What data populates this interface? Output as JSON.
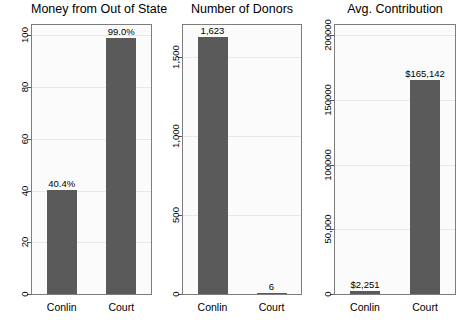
{
  "chart_data": [
    {
      "type": "bar",
      "title": "Money from Out of State",
      "xlabel": "",
      "ylabel": "",
      "categories": [
        "Conlin",
        "Court"
      ],
      "values": [
        40.4,
        99.0
      ],
      "data_labels": [
        "40.4%",
        "99.0%"
      ],
      "ylim": [
        0,
        104
      ],
      "yticks": [
        0,
        20,
        40,
        60,
        80,
        100
      ],
      "ytick_labels": [
        "0",
        "20",
        "40",
        "60",
        "80",
        "100"
      ],
      "grid": true,
      "legend": "none",
      "bar_color": "#5a5a5a"
    },
    {
      "type": "bar",
      "title": "Number of Donors",
      "xlabel": "",
      "ylabel": "",
      "categories": [
        "Conlin",
        "Court"
      ],
      "values": [
        1623,
        6
      ],
      "data_labels": [
        "1,623",
        "6"
      ],
      "ylim": [
        0,
        1700
      ],
      "yticks": [
        0,
        500,
        1000,
        1500
      ],
      "ytick_labels": [
        "0",
        "500",
        "1,000",
        "1,500"
      ],
      "grid": true,
      "legend": "none",
      "bar_color": "#5a5a5a"
    },
    {
      "type": "bar",
      "title": "Avg. Contribution",
      "xlabel": "",
      "ylabel": "",
      "categories": [
        "Conlin",
        "Court"
      ],
      "values": [
        2251,
        165142
      ],
      "data_labels": [
        "$2,251",
        "$165,142"
      ],
      "ylim": [
        0,
        208000
      ],
      "yticks": [
        0,
        50000,
        100000,
        150000,
        200000
      ],
      "ytick_labels": [
        "0",
        "50,000",
        "100000",
        "150000",
        "200000"
      ],
      "grid": true,
      "legend": "none",
      "bar_color": "#5a5a5a"
    }
  ],
  "figure": {
    "background": "#ffffff",
    "panel_background": "#fbfbfb",
    "frame_color": "#7d7d7d",
    "grid_color": "#e9e9e9",
    "bar_color": "#5a5a5a"
  }
}
